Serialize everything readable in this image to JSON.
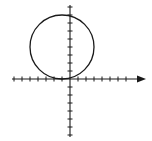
{
  "diagram": {
    "type": "coordinate-plane-with-circle",
    "circle": {
      "center": [
        -1,
        4
      ],
      "radius": 4
    },
    "x_ticks": {
      "min": -7,
      "max": 7
    },
    "y_ticks": {
      "min": -7,
      "max": 9
    },
    "x_axis_arrow": "right",
    "stroke_color": "#1a1a1a"
  }
}
